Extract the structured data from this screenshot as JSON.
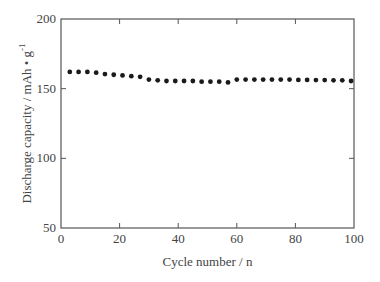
{
  "chart_data": {
    "type": "scatter",
    "title": "",
    "xlabel": "Cycle number / n",
    "ylabel": "Discharge capacity / mAh • g",
    "ylabel_superscript": "-1",
    "xlim": [
      0,
      100
    ],
    "ylim": [
      50,
      200
    ],
    "xticks": [
      0,
      20,
      40,
      60,
      80,
      100
    ],
    "yticks": [
      50,
      100,
      150,
      200
    ],
    "grid": false,
    "legend": null,
    "marker": "filled-circle",
    "color": "#1a1a1a",
    "series": [
      {
        "name": "Discharge capacity",
        "x": [
          3,
          6,
          9,
          12,
          15,
          18,
          21,
          24,
          27,
          30,
          33,
          36,
          39,
          42,
          45,
          48,
          51,
          54,
          57,
          60,
          63,
          66,
          69,
          72,
          75,
          78,
          81,
          84,
          87,
          90,
          93,
          96,
          99
        ],
        "y": [
          162,
          162,
          162,
          161.5,
          160.5,
          160,
          159.5,
          159,
          158.5,
          156.5,
          156,
          155.5,
          155.5,
          155.5,
          155.5,
          155,
          155,
          155,
          154.5,
          156.5,
          156.5,
          156.5,
          156.5,
          156.5,
          156.5,
          156.5,
          156.3,
          156.3,
          156.2,
          156.2,
          156,
          156,
          155.5
        ]
      }
    ]
  }
}
